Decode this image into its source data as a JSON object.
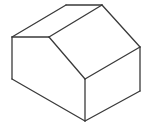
{
  "figure": {
    "stroke_color": "#3a3a3a",
    "background": "#ffffff",
    "vertices": {
      "left_eave_top": [
        12,
        37
      ],
      "left_eave_bottom": [
        12,
        79
      ],
      "ridge_back": [
        66,
        5
      ],
      "ridge_front_right": [
        102,
        5
      ],
      "inner_eave": [
        49,
        37
      ],
      "front_corner_top": [
        85,
        79
      ],
      "front_corner_bottom": [
        85,
        121
      ],
      "right_eave_top": [
        140,
        47
      ],
      "right_eave_bottom": [
        140,
        91
      ]
    },
    "edges": [
      [
        "left_eave_top",
        "ridge_back"
      ],
      [
        "ridge_back",
        "ridge_front_right"
      ],
      [
        "left_eave_top",
        "inner_eave"
      ],
      [
        "inner_eave",
        "ridge_front_right"
      ],
      [
        "ridge_front_right",
        "right_eave_top"
      ],
      [
        "inner_eave",
        "front_corner_top"
      ],
      [
        "front_corner_top",
        "right_eave_top"
      ],
      [
        "left_eave_top",
        "left_eave_bottom"
      ],
      [
        "left_eave_bottom",
        "front_corner_bottom"
      ],
      [
        "front_corner_top",
        "front_corner_bottom"
      ],
      [
        "front_corner_bottom",
        "right_eave_bottom"
      ],
      [
        "right_eave_top",
        "right_eave_bottom"
      ]
    ]
  }
}
